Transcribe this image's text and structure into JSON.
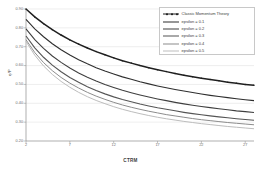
{
  "chart_data": {
    "type": "line",
    "title": "",
    "xlabel": "CTRM",
    "ylabel": "η/P",
    "xlim": [
      2,
      28
    ],
    "ylim": [
      0.2,
      0.9
    ],
    "grid": "horizontal",
    "legend_position": "top-right",
    "xticks": [
      "2",
      "7",
      "12",
      "17",
      "22",
      "27"
    ],
    "yticks": [
      "0.90",
      "0.80",
      "0.70",
      "0.60",
      "0.50",
      "0.40",
      "0.30",
      "0.20"
    ],
    "x": [
      2,
      3,
      4,
      5,
      6,
      7,
      8,
      9,
      10,
      11,
      12,
      13,
      14,
      15,
      16,
      17,
      18,
      19,
      20,
      21,
      22,
      23,
      24,
      25,
      26,
      27,
      28
    ],
    "series": [
      {
        "name": "Classic Momentum Theory",
        "color": "#1f1f1f",
        "width": 1.5,
        "markers": true,
        "values": [
          0.9,
          0.858,
          0.822,
          0.79,
          0.762,
          0.736,
          0.714,
          0.693,
          0.674,
          0.657,
          0.641,
          0.626,
          0.613,
          0.6,
          0.589,
          0.578,
          0.568,
          0.558,
          0.549,
          0.541,
          0.533,
          0.526,
          0.519,
          0.512,
          0.506,
          0.5,
          0.495
        ]
      },
      {
        "name": "epsilon = 0.1",
        "color": "#2e2e2e",
        "width": 1.1,
        "markers": false,
        "values": [
          0.845,
          0.795,
          0.753,
          0.716,
          0.684,
          0.656,
          0.631,
          0.609,
          0.589,
          0.571,
          0.555,
          0.54,
          0.527,
          0.514,
          0.503,
          0.492,
          0.482,
          0.473,
          0.465,
          0.457,
          0.449,
          0.442,
          0.436,
          0.43,
          0.424,
          0.419,
          0.414
        ]
      },
      {
        "name": "epsilon = 0.2",
        "color": "#3f3f3f",
        "width": 1.1,
        "markers": false,
        "values": [
          0.795,
          0.738,
          0.691,
          0.651,
          0.617,
          0.587,
          0.561,
          0.538,
          0.518,
          0.5,
          0.484,
          0.469,
          0.456,
          0.444,
          0.433,
          0.423,
          0.414,
          0.405,
          0.397,
          0.39,
          0.383,
          0.377,
          0.371,
          0.366,
          0.36,
          0.356,
          0.351
        ]
      },
      {
        "name": "epsilon = 0.3",
        "color": "#555555",
        "width": 1.1,
        "markers": false,
        "values": [
          0.757,
          0.694,
          0.644,
          0.602,
          0.567,
          0.537,
          0.511,
          0.488,
          0.468,
          0.45,
          0.434,
          0.42,
          0.408,
          0.396,
          0.386,
          0.376,
          0.368,
          0.36,
          0.352,
          0.345,
          0.339,
          0.333,
          0.328,
          0.323,
          0.318,
          0.314,
          0.31
        ]
      },
      {
        "name": "epsilon = 0.4",
        "color": "#8c8c8c",
        "width": 1.0,
        "markers": false,
        "values": [
          0.737,
          0.669,
          0.616,
          0.573,
          0.537,
          0.507,
          0.481,
          0.458,
          0.438,
          0.421,
          0.405,
          0.391,
          0.379,
          0.368,
          0.358,
          0.349,
          0.34,
          0.333,
          0.326,
          0.319,
          0.313,
          0.308,
          0.303,
          0.298,
          0.294,
          0.29,
          0.286
        ]
      },
      {
        "name": "epsilon = 0.5",
        "color": "#bdbdbd",
        "width": 1.0,
        "markers": false,
        "values": [
          0.728,
          0.655,
          0.598,
          0.553,
          0.516,
          0.485,
          0.458,
          0.435,
          0.415,
          0.398,
          0.382,
          0.368,
          0.356,
          0.345,
          0.335,
          0.326,
          0.318,
          0.311,
          0.304,
          0.298,
          0.292,
          0.287,
          0.282,
          0.277,
          0.273,
          0.269,
          0.265
        ]
      }
    ]
  }
}
